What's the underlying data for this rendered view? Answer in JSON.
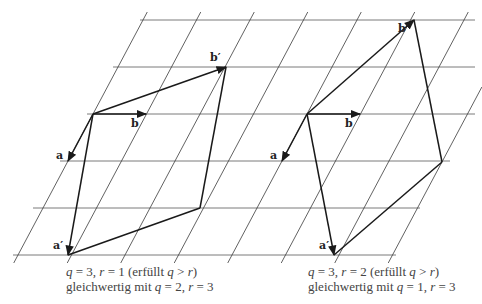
{
  "panels": [
    {
      "id": "left",
      "labels": {
        "a": "a",
        "b": "b",
        "a_prime": "a′",
        "b_prime": "b′"
      },
      "caption_line1": "q = 3, r = 1 (erfüllt q > r)",
      "caption_line2": "gleichwertig mit q = 2, r = 3",
      "caption": {
        "l1": [
          {
            "t": "q",
            "i": true
          },
          {
            "t": " = 3, "
          },
          {
            "t": "r",
            "i": true
          },
          {
            "t": " = 1 (erfüllt "
          },
          {
            "t": "q",
            "i": true
          },
          {
            "t": " > "
          },
          {
            "t": "r",
            "i": true
          },
          {
            "t": ")"
          }
        ],
        "l2": [
          {
            "t": "gleichwertig mit "
          },
          {
            "t": "q",
            "i": true
          },
          {
            "t": " = 2, "
          },
          {
            "t": "r",
            "i": true
          },
          {
            "t": " = 3"
          }
        ]
      },
      "points": {
        "origin": [
          93,
          114
        ],
        "a": [
          68,
          161
        ],
        "b": [
          146,
          114
        ],
        "a_prime": [
          68,
          255
        ],
        "b_prime": [
          226,
          67
        ],
        "corner": [
          200,
          208
        ]
      }
    },
    {
      "id": "right",
      "labels": {
        "a": "a",
        "b": "b",
        "a_prime": "a′",
        "b_prime": "b′"
      },
      "caption_line1": "q = 3, r = 2 (erfüllt q > r)",
      "caption_line2": "gleichwertig mit q = 1, r = 3",
      "caption": {
        "l1": [
          {
            "t": "q",
            "i": true
          },
          {
            "t": " = 3, "
          },
          {
            "t": "r",
            "i": true
          },
          {
            "t": " = 2 (erfüllt "
          },
          {
            "t": "q",
            "i": true
          },
          {
            "t": " > "
          },
          {
            "t": "r",
            "i": true
          },
          {
            "t": ")"
          }
        ],
        "l2": [
          {
            "t": "gleichwertig mit "
          },
          {
            "t": "q",
            "i": true
          },
          {
            "t": " = 1, "
          },
          {
            "t": "r",
            "i": true
          },
          {
            "t": " = 3"
          }
        ]
      },
      "points": {
        "origin": [
          307,
          114
        ],
        "a": [
          282,
          161
        ],
        "b": [
          360,
          114
        ],
        "a_prime": [
          334,
          255
        ],
        "b_prime": [
          414,
          20
        ],
        "corner": [
          442,
          162
        ]
      }
    }
  ],
  "grid": {
    "horizontal_lines": [
      {
        "y": 20,
        "x1": 140,
        "x2": 475
      },
      {
        "y": 67,
        "x1": 113,
        "x2": 475
      },
      {
        "y": 114,
        "x1": 87,
        "x2": 475
      },
      {
        "y": 161,
        "x1": 60,
        "x2": 450
      },
      {
        "y": 208,
        "x1": 33,
        "x2": 420
      },
      {
        "y": 255,
        "x1": 13,
        "x2": 396
      }
    ],
    "lattice_b_dx": 53.5,
    "lattice_a_step": [
      25,
      47
    ],
    "slanted_count": 9
  }
}
